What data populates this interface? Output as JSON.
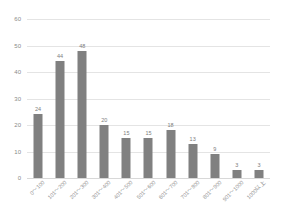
{
  "chart_data": {
    "type": "bar",
    "title": "",
    "subtitle": "",
    "xlabel": "",
    "ylabel": "",
    "ylim": [
      0,
      60
    ],
    "yticks": [
      0,
      10,
      20,
      30,
      40,
      50,
      60
    ],
    "grid": true,
    "legend": false,
    "legend_position": "none",
    "orientation": "vertical",
    "bar_color": "#808080",
    "background_color": "#ffffff",
    "gridline_color": "#e4e4e4",
    "label_color": "#8a8a8a",
    "value_labels_shown": true,
    "xtick_rotation": -45,
    "categories": [
      "0～100",
      "101～200",
      "201～300",
      "301～400",
      "401～500",
      "501～600",
      "601～700",
      "701～800",
      "801～900",
      "901～1000",
      "1000以上"
    ],
    "values": [
      24,
      44,
      48,
      20,
      15,
      15,
      18,
      13,
      9,
      3,
      3
    ]
  }
}
